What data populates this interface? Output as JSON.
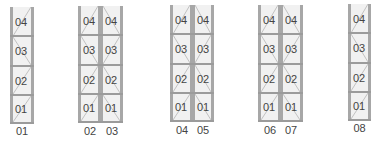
{
  "colors": {
    "frame": "#a7a7a7",
    "fill": "#f1f1f1",
    "beam": "#9b9b9b",
    "text": "#444444",
    "diagonal": "#b5b5b5"
  },
  "levels": [
    "04",
    "03",
    "02",
    "01"
  ],
  "racks": [
    {
      "id": "rack-01",
      "bays": [
        {
          "label": "01",
          "levels": [
            "04",
            "03",
            "02",
            "01"
          ]
        }
      ]
    },
    {
      "id": "rack-02-03",
      "bays": [
        {
          "label": "02",
          "levels": [
            "04",
            "03",
            "02",
            "01"
          ]
        },
        {
          "label": "03",
          "levels": [
            "04",
            "03",
            "02",
            "01"
          ]
        }
      ]
    },
    {
      "id": "rack-04-05",
      "bays": [
        {
          "label": "04",
          "levels": [
            "04",
            "03",
            "02",
            "01"
          ]
        },
        {
          "label": "05",
          "levels": [
            "04",
            "03",
            "02",
            "01"
          ]
        }
      ]
    },
    {
      "id": "rack-06-07",
      "bays": [
        {
          "label": "06",
          "levels": [
            "04",
            "03",
            "02",
            "01"
          ]
        },
        {
          "label": "07",
          "levels": [
            "04",
            "03",
            "02",
            "01"
          ]
        }
      ]
    },
    {
      "id": "rack-08",
      "bays": [
        {
          "label": "08",
          "levels": [
            "04",
            "03",
            "02",
            "01"
          ]
        }
      ]
    }
  ]
}
